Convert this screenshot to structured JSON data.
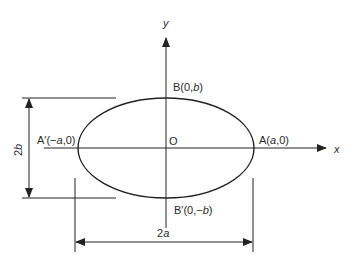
{
  "figure": {
    "type": "ellipse-diagram",
    "axes": {
      "x_label": "x",
      "y_label": "y"
    },
    "origin_label": "O",
    "points": {
      "A": {
        "prefix": "A(",
        "var": "a",
        "suffix": ",0)"
      },
      "A_prime": {
        "prefix": "A′(−",
        "var": "a",
        "suffix": ",0)"
      },
      "B": {
        "prefix": "B(0,",
        "var": "b",
        "suffix": ")"
      },
      "B_prime": {
        "prefix": "B′(0,−",
        "var": "b",
        "suffix": ")"
      }
    },
    "dimensions": {
      "major": {
        "num": "2",
        "var": "a"
      },
      "minor": {
        "num": "2",
        "var": "b"
      }
    },
    "colors": {
      "stroke": "#222222",
      "background": "#ffffff"
    }
  }
}
